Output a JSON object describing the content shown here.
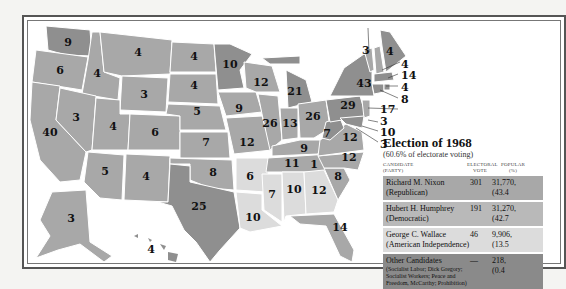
{
  "colors": {
    "republican": "#a8a8a8",
    "democratic": "#8f8f8f",
    "american_independent": "#dcdcdc",
    "other": "#8a8a8a",
    "background": "#ffffff",
    "border": "#555555"
  },
  "map": {
    "states": [
      {
        "id": "WA",
        "votes": "9"
      },
      {
        "id": "OR",
        "votes": "6"
      },
      {
        "id": "CA",
        "votes": "40"
      },
      {
        "id": "ID",
        "votes": "4"
      },
      {
        "id": "NV",
        "votes": "3"
      },
      {
        "id": "MT",
        "votes": "4"
      },
      {
        "id": "WY",
        "votes": "3"
      },
      {
        "id": "UT",
        "votes": "4"
      },
      {
        "id": "AZ",
        "votes": "5"
      },
      {
        "id": "CO",
        "votes": "6"
      },
      {
        "id": "NM",
        "votes": "4"
      },
      {
        "id": "ND",
        "votes": "4"
      },
      {
        "id": "SD",
        "votes": "4"
      },
      {
        "id": "NE",
        "votes": "5"
      },
      {
        "id": "KS",
        "votes": "7"
      },
      {
        "id": "OK",
        "votes": "8"
      },
      {
        "id": "TX",
        "votes": "25"
      },
      {
        "id": "MN",
        "votes": "10"
      },
      {
        "id": "IA",
        "votes": "9"
      },
      {
        "id": "MO",
        "votes": "12"
      },
      {
        "id": "AR",
        "votes": "6"
      },
      {
        "id": "LA",
        "votes": "10"
      },
      {
        "id": "WI",
        "votes": "12"
      },
      {
        "id": "IL",
        "votes": "26"
      },
      {
        "id": "MI",
        "votes": "21"
      },
      {
        "id": "IN",
        "votes": "13"
      },
      {
        "id": "OH",
        "votes": "26"
      },
      {
        "id": "KY",
        "votes": "9"
      },
      {
        "id": "TN",
        "votes": "11"
      },
      {
        "id": "MS",
        "votes": "7"
      },
      {
        "id": "AL",
        "votes": "10"
      },
      {
        "id": "GA",
        "votes": "12"
      },
      {
        "id": "FL",
        "votes": "14"
      },
      {
        "id": "SC",
        "votes": "8"
      },
      {
        "id": "NC",
        "votes": "12"
      },
      {
        "id": "NC_split",
        "votes": "1"
      },
      {
        "id": "VA",
        "votes": "12"
      },
      {
        "id": "WV",
        "votes": "7"
      },
      {
        "id": "PA",
        "votes": "29"
      },
      {
        "id": "NY",
        "votes": "43"
      },
      {
        "id": "VT",
        "votes": "3"
      },
      {
        "id": "ME",
        "votes": "4"
      },
      {
        "id": "NH",
        "votes": "4"
      },
      {
        "id": "MA",
        "votes": "14"
      },
      {
        "id": "RI",
        "votes": "4"
      },
      {
        "id": "CT",
        "votes": "8"
      },
      {
        "id": "NJ",
        "votes": "17"
      },
      {
        "id": "DE",
        "votes": "3"
      },
      {
        "id": "MD",
        "votes": "10"
      },
      {
        "id": "DC",
        "votes": "3"
      },
      {
        "id": "AK",
        "votes": "3"
      },
      {
        "id": "HI",
        "votes": "4"
      }
    ]
  },
  "legend": {
    "title": "Election of 1968",
    "subtitle": "(60.6% of electorate voting)",
    "headers": {
      "candidate": "CANDIDATE",
      "party": "(PARTY)",
      "electoral": "ELECTORAL",
      "vote": "VOTE",
      "popular": "POPULAR",
      "pct": "(%)"
    },
    "rows": [
      {
        "name": "Richard M. Nixon",
        "party": "(Republican)",
        "electoral": "301",
        "popular": "31,770,",
        "pct": "(43.4"
      },
      {
        "name": "Hubert H. Humphrey",
        "party": "(Democratic)",
        "electoral": "191",
        "popular": "31,270,",
        "pct": "(42.7"
      },
      {
        "name": "George C. Wallace",
        "party": "(American Independence)",
        "electoral": "46",
        "popular": "9,906,",
        "pct": "(13.5"
      },
      {
        "name": "Other Candidates",
        "party": "(Socialist Labor; Dick Gregory; Socialist Workers; Peace and Freedom, McCarthy; Prohibition)",
        "electoral": "—",
        "popular": "218,",
        "pct": "(0.4"
      }
    ]
  }
}
